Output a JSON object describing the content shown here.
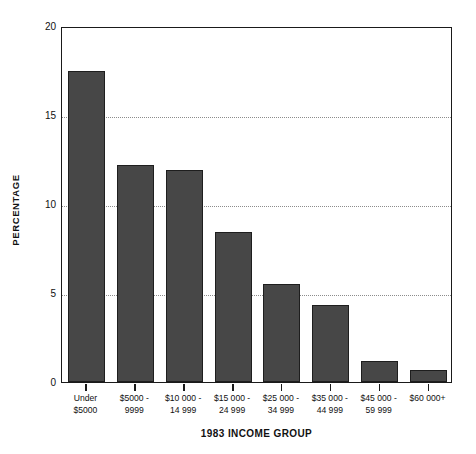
{
  "chart_data": {
    "type": "bar",
    "title": "",
    "xlabel": "1983 INCOME GROUP",
    "ylabel": "PERCENTAGE",
    "ylim": [
      0,
      20
    ],
    "yticks": [
      0,
      5,
      10,
      15,
      20
    ],
    "ytick_labels": [
      "0",
      "5",
      "10",
      "15",
      "20"
    ],
    "grid": "horizontal-dotted",
    "legend": "none",
    "bar_color": "#474747",
    "bar_edge_color": "#1e1e1e",
    "grid_color": "#8c8c8c",
    "axis_color": "#1a1a1a",
    "background": "#ffffff",
    "categories": [
      "Under $5000",
      "$5000 - 9999",
      "$10 000 - 14 999",
      "$15 000 - 24 999",
      "$25 000 - 34 999",
      "$35 000 - 44 999",
      "$45 000 - 59 999",
      "$60 000+"
    ],
    "category_lines": [
      [
        "Under",
        "$5000"
      ],
      [
        "$5000 -",
        "9999"
      ],
      [
        "$10 000 -",
        "14 999"
      ],
      [
        "$15 000 -",
        "24 999"
      ],
      [
        "$25 000 -",
        "34 999"
      ],
      [
        "$35 000 -",
        "44 999"
      ],
      [
        "$45 000 -",
        "59 999"
      ],
      [
        "$60 000+",
        ""
      ]
    ],
    "values": [
      17.5,
      12.2,
      11.9,
      8.4,
      5.5,
      4.3,
      1.2,
      0.65
    ]
  }
}
